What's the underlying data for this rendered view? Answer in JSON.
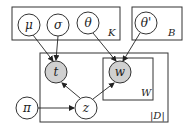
{
  "diagram": {
    "type": "plate-notation",
    "colors": {
      "observed": "#d0d0d0",
      "latent": "#ffffff",
      "stroke": "#333333"
    },
    "plates": {
      "K": {
        "label": "K"
      },
      "B": {
        "label": "B"
      },
      "D": {
        "label": "|D|"
      },
      "W": {
        "label": "W"
      }
    },
    "nodes": {
      "mu": {
        "label": "μ",
        "observed": false
      },
      "sigma": {
        "label": "σ",
        "observed": false
      },
      "theta": {
        "label": "θ",
        "observed": false
      },
      "theta_prime": {
        "label": "θ'",
        "observed": false
      },
      "t": {
        "label": "t",
        "observed": true
      },
      "w": {
        "label": "w",
        "observed": true
      },
      "pi": {
        "label": "π",
        "observed": false
      },
      "z": {
        "label": "z",
        "observed": false
      }
    },
    "edges": [
      [
        "μ",
        "t"
      ],
      [
        "σ",
        "t"
      ],
      [
        "θ",
        "w"
      ],
      [
        "θ'",
        "w"
      ],
      [
        "π",
        "z"
      ],
      [
        "z",
        "t"
      ],
      [
        "z",
        "w"
      ]
    ]
  }
}
